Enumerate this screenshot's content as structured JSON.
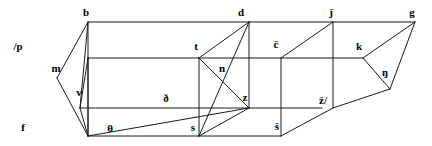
{
  "figure": {
    "width": 432,
    "height": 146,
    "background_color": "#ffffff",
    "stroke_color": "#1a1a1a",
    "text_color": "#000000"
  },
  "vertices": [
    {
      "id": "p",
      "label": "/p",
      "x": 88,
      "y": 58,
      "lx": 18,
      "ly": 46
    },
    {
      "id": "b",
      "label": "b",
      "x": 88,
      "y": 22,
      "lx": 86,
      "ly": 12
    },
    {
      "id": "f",
      "label": "f",
      "x": 88,
      "y": 136,
      "lx": 23,
      "ly": 127
    },
    {
      "id": "m",
      "label": "m",
      "x": 57,
      "y": 78,
      "lx": 56,
      "ly": 68
    },
    {
      "id": "v",
      "label": "v",
      "x": 80,
      "y": 108,
      "lx": 79,
      "ly": 92
    },
    {
      "id": "th",
      "label": "θ",
      "x": 110,
      "y": 128,
      "lx": 110,
      "ly": 128
    },
    {
      "id": "dh",
      "label": "ð",
      "x": 166,
      "y": 98,
      "lx": 166,
      "ly": 98
    },
    {
      "id": "t",
      "label": "t",
      "x": 199,
      "y": 58,
      "lx": 196,
      "ly": 46
    },
    {
      "id": "d",
      "label": "d",
      "x": 249,
      "y": 22,
      "lx": 241,
      "ly": 12
    },
    {
      "id": "s",
      "label": "s",
      "x": 199,
      "y": 136,
      "lx": 193,
      "ly": 127
    },
    {
      "id": "n",
      "label": "n",
      "x": 222,
      "y": 78,
      "lx": 222,
      "ly": 68
    },
    {
      "id": "z",
      "label": "z",
      "x": 249,
      "y": 108,
      "lx": 245,
      "ly": 97
    },
    {
      "id": "cc",
      "label": "č",
      "x": 281,
      "y": 58,
      "lx": 276,
      "ly": 44
    },
    {
      "id": "ss",
      "label": "š",
      "x": 281,
      "y": 136,
      "lx": 277,
      "ly": 126
    },
    {
      "id": "zz",
      "label": "ž/",
      "x": 322,
      "y": 100,
      "lx": 323,
      "ly": 100
    },
    {
      "id": "jj",
      "label": "ǰ",
      "x": 333,
      "y": 22,
      "lx": 331,
      "ly": 12
    },
    {
      "id": "k",
      "label": "k",
      "x": 363,
      "y": 58,
      "lx": 359,
      "ly": 46
    },
    {
      "id": "g",
      "label": "g",
      "x": 415,
      "y": 22,
      "lx": 412,
      "ly": 12
    },
    {
      "id": "ng",
      "label": "ŋ",
      "x": 390,
      "y": 89,
      "lx": 385,
      "ly": 72
    }
  ],
  "edges": [
    {
      "name": "p-b",
      "x1": 88,
      "y1": 58,
      "x2": 88,
      "y2": 22
    },
    {
      "name": "p-f",
      "x1": 88,
      "y1": 58,
      "x2": 88,
      "y2": 136
    },
    {
      "name": "b-d",
      "x1": 88,
      "y1": 22,
      "x2": 249,
      "y2": 22
    },
    {
      "name": "p-t",
      "x1": 88,
      "y1": 58,
      "x2": 199,
      "y2": 58
    },
    {
      "name": "f-s",
      "x1": 88,
      "y1": 136,
      "x2": 199,
      "y2": 136
    },
    {
      "name": "b-v",
      "x1": 88,
      "y1": 22,
      "x2": 80,
      "y2": 108
    },
    {
      "name": "b-m",
      "x1": 88,
      "y1": 22,
      "x2": 57,
      "y2": 78
    },
    {
      "name": "p-v",
      "x1": 88,
      "y1": 58,
      "x2": 80,
      "y2": 108
    },
    {
      "name": "p-vz",
      "x1": 88,
      "y1": 58,
      "x2": 88,
      "y2": 136
    },
    {
      "name": "m-f",
      "x1": 57,
      "y1": 78,
      "x2": 88,
      "y2": 136
    },
    {
      "name": "f-v",
      "x1": 88,
      "y1": 136,
      "x2": 80,
      "y2": 108
    },
    {
      "name": "v-theta",
      "x1": 80,
      "y1": 108,
      "x2": 249,
      "y2": 108
    },
    {
      "name": "f-delta",
      "x1": 88,
      "y1": 136,
      "x2": 249,
      "y2": 108
    },
    {
      "name": "t-d",
      "x1": 199,
      "y1": 58,
      "x2": 249,
      "y2": 22
    },
    {
      "name": "t-s",
      "x1": 199,
      "y1": 58,
      "x2": 199,
      "y2": 136
    },
    {
      "name": "d-z",
      "x1": 249,
      "y1": 22,
      "x2": 249,
      "y2": 108
    },
    {
      "name": "t-z",
      "x1": 199,
      "y1": 58,
      "x2": 249,
      "y2": 108
    },
    {
      "name": "d-s",
      "x1": 249,
      "y1": 22,
      "x2": 199,
      "y2": 136
    },
    {
      "name": "s-z",
      "x1": 199,
      "y1": 136,
      "x2": 249,
      "y2": 108
    },
    {
      "name": "d-jj",
      "x1": 249,
      "y1": 22,
      "x2": 333,
      "y2": 22
    },
    {
      "name": "t-cc",
      "x1": 199,
      "y1": 58,
      "x2": 281,
      "y2": 58
    },
    {
      "name": "s-ss",
      "x1": 199,
      "y1": 136,
      "x2": 281,
      "y2": 136
    },
    {
      "name": "z-zz",
      "x1": 249,
      "y1": 108,
      "x2": 322,
      "y2": 108
    },
    {
      "name": "cc-jj",
      "x1": 281,
      "y1": 58,
      "x2": 333,
      "y2": 22
    },
    {
      "name": "cc-ss",
      "x1": 281,
      "y1": 58,
      "x2": 281,
      "y2": 136
    },
    {
      "name": "jj-zz",
      "x1": 333,
      "y1": 22,
      "x2": 333,
      "y2": 108
    },
    {
      "name": "ss-zz",
      "x1": 281,
      "y1": 136,
      "x2": 333,
      "y2": 108
    },
    {
      "name": "cc-k",
      "x1": 281,
      "y1": 58,
      "x2": 363,
      "y2": 58
    },
    {
      "name": "jj-g",
      "x1": 333,
      "y1": 22,
      "x2": 415,
      "y2": 22
    },
    {
      "name": "zz-ng",
      "x1": 333,
      "y1": 108,
      "x2": 390,
      "y2": 89
    },
    {
      "name": "k-g",
      "x1": 363,
      "y1": 58,
      "x2": 415,
      "y2": 22
    },
    {
      "name": "k-ng",
      "x1": 363,
      "y1": 58,
      "x2": 390,
      "y2": 89
    },
    {
      "name": "g-ng",
      "x1": 415,
      "y1": 22,
      "x2": 390,
      "y2": 89
    }
  ]
}
